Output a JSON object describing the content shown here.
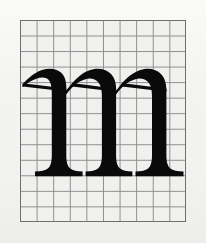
{
  "figure": {
    "kind": "type-specimen-grid-diagram",
    "caption": "",
    "background_color": "#f2f2f0",
    "plate": {
      "x": 20,
      "y": 20,
      "width": 166,
      "height": 202,
      "border_color": "#6f6f6f"
    }
  },
  "grid": {
    "name": "proportion-grid",
    "columns": 10,
    "rows": 13,
    "cell_width": 16.6,
    "cell_height": 15.5,
    "line_color": "#8d8d8d",
    "fill_color": "#f0f0ee",
    "visible": true
  },
  "glyph": {
    "character": "m",
    "case": "lowercase",
    "style": "serif",
    "ink_color": "#0a0a0a",
    "metrics": {
      "x_height_line_row": 4,
      "baseline_row": 10,
      "left_edge_column": 0,
      "right_edge_column": 10,
      "stem_count": 3,
      "arch_count": 2
    }
  },
  "chart_data": {
    "type": "table",
    "xlabel": "grid columns",
    "ylabel": "grid rows",
    "categories": [
      "columns",
      "rows",
      "stems",
      "arches",
      "x-height rows",
      "descender rows"
    ],
    "values": [
      10,
      13,
      3,
      2,
      6,
      0
    ],
    "annotations": [
      "baseline at row 10",
      "x-height top at row 4"
    ],
    "grid": true,
    "legend": "none"
  }
}
